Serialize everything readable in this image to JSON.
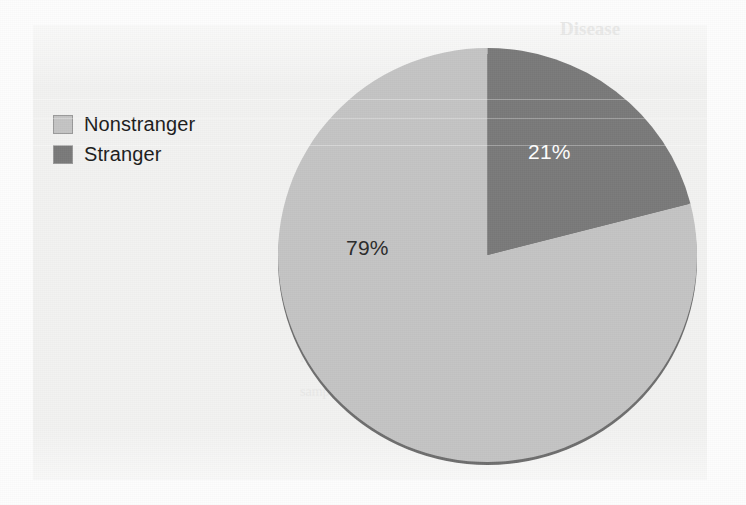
{
  "figure": {
    "background_color": "#f2f2f1",
    "page_color": "#fdfdfd"
  },
  "legend": {
    "position": "top-left",
    "items": [
      {
        "label": "Nonstranger",
        "color": "#c4c4c4",
        "swatch_name": "legend-swatch-nonstranger"
      },
      {
        "label": "Stranger",
        "color": "#7a7a7a",
        "swatch_name": "legend-swatch-stranger"
      }
    ]
  },
  "labels": {
    "stranger_pct": "21%",
    "nonstranger_pct": "79%"
  },
  "bleed_through_text": {
    "line1": "Disease",
    "line2": "relationship to the assailant by",
    "line3": "assailant and number (N)",
    "line4": "Number     Percentage",
    "line5": "sample"
  },
  "chart_data": {
    "type": "pie",
    "title": "",
    "categories": [
      "Nonstranger",
      "Stranger"
    ],
    "values": [
      79,
      21
    ],
    "labels": [
      "79%",
      "21%"
    ],
    "colors": [
      "#c4c4c4",
      "#7a7a7a"
    ],
    "label_colors": [
      "#2b2b2b",
      "#ffffff"
    ],
    "units": "percent",
    "total": 100,
    "start_angle_deg": 0,
    "direction": "clockwise",
    "legend": true,
    "legend_position": "top-left",
    "grid": false,
    "three_d": true
  }
}
